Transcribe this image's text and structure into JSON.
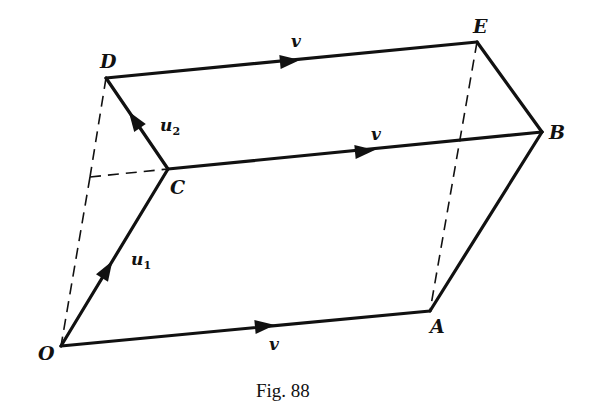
{
  "figure": {
    "caption": "Fig. 88",
    "vertices": {
      "O": {
        "label": "O",
        "x": 61,
        "y": 346
      },
      "A": {
        "label": "A",
        "x": 430,
        "y": 311
      },
      "C": {
        "label": "C",
        "x": 168,
        "y": 169
      },
      "B": {
        "label": "B",
        "x": 542,
        "y": 132
      },
      "D": {
        "label": "D",
        "x": 106,
        "y": 78
      },
      "E": {
        "label": "E",
        "x": 477,
        "y": 42
      },
      "H": {
        "label": "",
        "x": 90,
        "y": 177
      }
    },
    "edge_labels": {
      "OA": "v",
      "CB": "v",
      "DE": "v",
      "OC_main": "u",
      "OC_sub": "1",
      "CD_main": "u",
      "CD_sub": "2"
    },
    "colors": {
      "ink": "#111111",
      "background": "#ffffff"
    }
  }
}
